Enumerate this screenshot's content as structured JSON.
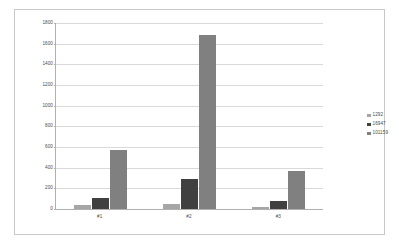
{
  "chart_data": {
    "type": "bar",
    "title": "",
    "subtitle": "",
    "xlabel": "",
    "ylabel": "",
    "categories": [
      "#1",
      "#2",
      "#3"
    ],
    "series": [
      {
        "name": "1292",
        "color": "#a6a6a6",
        "values": [
          40,
          45,
          20
        ]
      },
      {
        "name": "16947",
        "color": "#404040",
        "values": [
          110,
          290,
          75
        ]
      },
      {
        "name": "101159",
        "color": "#808080",
        "values": [
          570,
          1680,
          370
        ]
      }
    ],
    "ylim": [
      0,
      1800
    ],
    "ytick_step": 200,
    "yticks": [
      0,
      200,
      400,
      600,
      800,
      1000,
      1200,
      1400,
      1600,
      1800
    ],
    "ytick_labels": [
      "0",
      "200",
      "400",
      "600",
      "800",
      "1000",
      "1200",
      "1400",
      "1600",
      "1800"
    ],
    "grid": {
      "horizontal": true,
      "vertical": false
    },
    "legend": {
      "position": "right",
      "entries": [
        "1292",
        "16947",
        "101159"
      ]
    },
    "plot_background": "#ffffff",
    "gridline_color": "#d9d9d9",
    "axis_color": "#b0b0b0",
    "border_color": "#c8c8c8",
    "tick_text_color": "#4a4a4a"
  }
}
